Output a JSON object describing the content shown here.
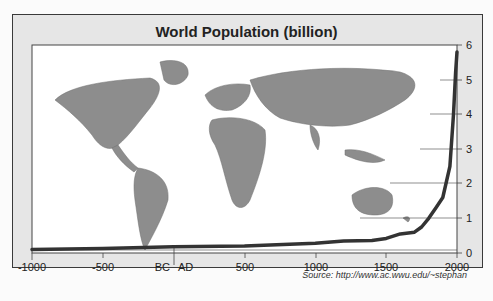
{
  "chart_data": {
    "type": "line",
    "title": "World Population (billion)",
    "xlabel": "",
    "ylabel": "",
    "x_tick_labels": [
      "-1000",
      "-500",
      "BC",
      "AD",
      "500",
      "1000",
      "1500",
      "2000"
    ],
    "y_tick_labels": [
      "0",
      "1",
      "2",
      "3",
      "4",
      "5",
      "6"
    ],
    "xlim": [
      -1000,
      2000
    ],
    "ylim": [
      0,
      6
    ],
    "grid": true,
    "background_image": "world-map",
    "source": "Source: http://www.ac.wwu.edu/~stephan",
    "series": [
      {
        "name": "World Population",
        "x": [
          -1000,
          -500,
          0,
          500,
          1000,
          1200,
          1400,
          1500,
          1600,
          1700,
          1750,
          1800,
          1850,
          1900,
          1950,
          1975,
          1990,
          2000
        ],
        "values": [
          0.1,
          0.13,
          0.18,
          0.2,
          0.28,
          0.35,
          0.36,
          0.42,
          0.55,
          0.6,
          0.75,
          1.0,
          1.3,
          1.6,
          2.5,
          4.0,
          5.2,
          5.8
        ]
      }
    ]
  },
  "labels": {
    "title": "World Population (billion)",
    "source": "Source: http://www.ac.wwu.edu/~stephan",
    "bc": "BC",
    "ad": "AD"
  }
}
